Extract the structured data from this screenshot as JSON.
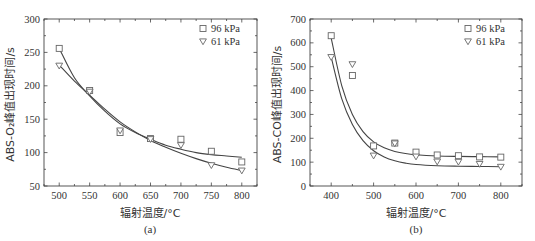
{
  "chart_data": [
    {
      "id": "a",
      "type": "scatter",
      "caption": "(a)",
      "title": "",
      "xlabel": "辐射温度/°C",
      "ylabel": "ABS-O₂峰值出现时间/s",
      "xlim": [
        475,
        825
      ],
      "ylim": [
        50,
        300
      ],
      "xticks": [
        500,
        550,
        600,
        650,
        700,
        750,
        800
      ],
      "yticks": [
        50,
        100,
        150,
        200,
        250,
        300
      ],
      "grid": false,
      "legend_position": "upper right",
      "series": [
        {
          "name": "96 kPa",
          "marker": "square",
          "x": [
            500,
            550,
            600,
            650,
            700,
            750,
            800
          ],
          "values": [
            256,
            193,
            130,
            121,
            120,
            102,
            86
          ],
          "fit": {
            "type": "exponential-decay",
            "x": [
              500,
              525,
              550,
              575,
              600,
              625,
              650,
              675,
              700,
              725,
              750,
              775,
              800
            ],
            "y": [
              256,
              212,
              185,
              162,
              143,
              130,
              120,
              111,
              105,
              100,
              97,
              95,
              93
            ]
          }
        },
        {
          "name": "61 kPa",
          "marker": "triangle-down",
          "x": [
            500,
            550,
            600,
            650,
            700,
            750,
            800
          ],
          "values": [
            230,
            191,
            133,
            120,
            111,
            81,
            73
          ],
          "fit": {
            "type": "exponential-decay",
            "x": [
              500,
              525,
              550,
              575,
              600,
              625,
              650,
              675,
              700,
              725,
              750,
              775,
              800
            ],
            "y": [
              231,
              207,
              186,
              165,
              146,
              131,
              118,
              108,
              99,
              91,
              84,
              78,
              73
            ]
          }
        }
      ]
    },
    {
      "id": "b",
      "type": "scatter",
      "caption": "(b)",
      "title": "",
      "xlabel": "辐射温度/°C",
      "ylabel": "ABS-CO峰值出现时间/s",
      "xlim": [
        350,
        850
      ],
      "ylim": [
        0,
        700
      ],
      "xticks": [
        400,
        500,
        600,
        700,
        800
      ],
      "yticks": [
        0,
        100,
        200,
        300,
        400,
        500,
        600,
        700
      ],
      "grid": false,
      "legend_position": "upper right",
      "series": [
        {
          "name": "96 kPa",
          "marker": "square",
          "x": [
            400,
            450,
            500,
            550,
            600,
            650,
            700,
            750,
            800
          ],
          "values": [
            630,
            463,
            168,
            180,
            142,
            130,
            127,
            122,
            121
          ],
          "fit": {
            "type": "exponential-decay",
            "x": [
              400,
              425,
              450,
              475,
              500,
              525,
              550,
              575,
              600,
              650,
              700,
              750,
              800
            ],
            "y": [
              620,
              420,
              300,
              228,
              185,
              160,
              145,
              136,
              131,
              126,
              124,
              123,
              122
            ]
          }
        },
        {
          "name": "61 kPa",
          "marker": "triangle-down",
          "x": [
            400,
            450,
            500,
            550,
            600,
            650,
            700,
            750,
            800
          ],
          "values": [
            540,
            510,
            127,
            178,
            123,
            102,
            101,
            92,
            80
          ],
          "fit": {
            "type": "exponential-decay",
            "x": [
              400,
              425,
              450,
              475,
              500,
              525,
              550,
              575,
              600,
              650,
              700,
              750,
              800
            ],
            "y": [
              540,
              365,
              258,
              190,
              148,
              122,
              106,
              96,
              90,
              85,
              83,
              82,
              81
            ]
          }
        }
      ]
    }
  ],
  "legend": {
    "items": [
      "96 kPa",
      "61 kPa"
    ]
  },
  "charts_ui": [
    {
      "caption": "(a)",
      "xlabel": "辐射温度/°C",
      "ylabel": "ABS-O₂峰值出现时间/s",
      "legend_1": "96 kPa",
      "legend_2": "61 kPa"
    },
    {
      "caption": "(b)",
      "xlabel": "辐射温度/°C",
      "ylabel": "ABS-CO峰值出现时间/s",
      "legend_1": "96 kPa",
      "legend_2": "61 kPa"
    }
  ],
  "colors": {
    "axis": "#444444",
    "marker": "#666666",
    "fit_line": "#444444",
    "background": "#ffffff"
  }
}
